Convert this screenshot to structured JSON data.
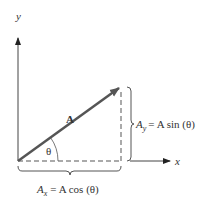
{
  "diagram": {
    "type": "vector-components",
    "axes": {
      "x_label": "x",
      "y_label": "y"
    },
    "vector": {
      "label": "A",
      "color": "#555555"
    },
    "angle": {
      "label": "θ"
    },
    "components": {
      "y": {
        "symbol": "A",
        "subscript": "y",
        "equation": "= A sin (θ)"
      },
      "x": {
        "symbol": "A",
        "subscript": "x",
        "equation": "= A cos (θ)"
      }
    },
    "colors": {
      "axis": "#333333",
      "vector": "#555555",
      "dashed": "#aaaaaa",
      "brace": "#555555",
      "text": "#333333"
    }
  }
}
